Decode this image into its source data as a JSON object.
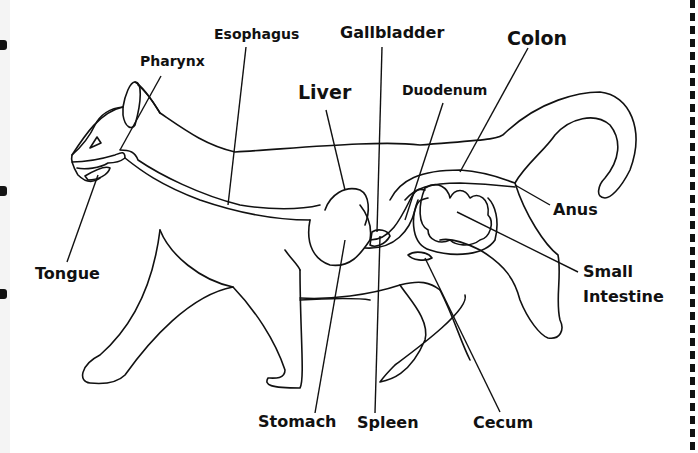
{
  "diagram": {
    "labels": {
      "esophagus": "Esophagus",
      "gallbladder": "Gallbladder",
      "colon": "Colon",
      "pharynx": "Pharynx",
      "liver": "Liver",
      "duodenum": "Duodenum",
      "anus": "Anus",
      "tongue": "Tongue",
      "small_intestine_line1": "Small",
      "small_intestine_line2": "Intestine",
      "stomach": "Stomach",
      "spleen": "Spleen",
      "cecum": "Cecum"
    },
    "colors": {
      "ink": "#111111",
      "background": "#ffffff"
    }
  }
}
